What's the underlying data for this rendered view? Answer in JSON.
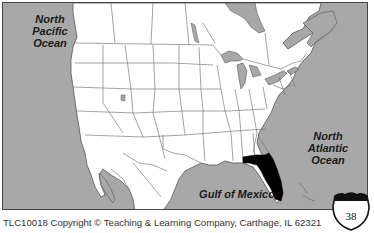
{
  "map": {
    "title": "North America outline map with Florida highlighted",
    "highlighted_state": "Florida",
    "colors": {
      "water": "#a8a8a8",
      "land": "#ffffff",
      "borders": "#555555",
      "highlight": "#000000"
    },
    "labels": {
      "pacific": "North Pacific Ocean",
      "pacific_lines": [
        "North",
        "Pacific",
        "Ocean"
      ],
      "atlantic": "North Atlantic Ocean",
      "atlantic_lines": [
        "North",
        "Atlantic",
        "Ocean"
      ],
      "gulf": "Gulf of Mexico"
    }
  },
  "footer": {
    "copyright": "TLC10018 Copyright © Teaching & Learning Company, Carthage, IL  62321"
  },
  "badge": {
    "type": "interstate-shield",
    "page_number": "38"
  }
}
